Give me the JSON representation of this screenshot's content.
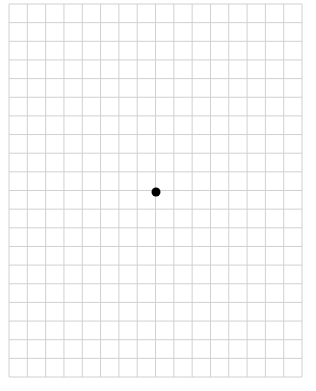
{
  "grid": {
    "left": 9,
    "top": 4,
    "right": 302,
    "bottom": 377,
    "columns": 16,
    "rows": 20,
    "line_color": "#d0d0d0",
    "background": "#ffffff"
  },
  "fixation_dot": {
    "cx": 156,
    "cy": 192,
    "radius": 4.5,
    "color": "#000000"
  }
}
